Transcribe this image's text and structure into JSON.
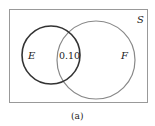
{
  "diagram": {
    "type": "venn",
    "universe_label": "S",
    "sets": [
      {
        "label": "E",
        "color": "#333333"
      },
      {
        "label": "F",
        "color": "#777777"
      }
    ],
    "intersection_value": "0.10",
    "caption": "(a)"
  }
}
